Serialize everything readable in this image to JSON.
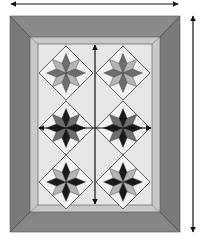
{
  "diagram": {
    "type": "quilt-layout",
    "blocks": {
      "rows": 3,
      "cols": 2,
      "pattern": "eight-point-star",
      "items": [
        {
          "row": 1,
          "col": 1,
          "style": "light",
          "cx": 66,
          "cy": 73
        },
        {
          "row": 1,
          "col": 2,
          "style": "light",
          "cx": 123,
          "cy": 73
        },
        {
          "row": 2,
          "col": 1,
          "style": "dark",
          "cx": 66,
          "cy": 128
        },
        {
          "row": 2,
          "col": 2,
          "style": "dark",
          "cx": 123,
          "cy": 128
        },
        {
          "row": 3,
          "col": 1,
          "style": "medium",
          "cx": 66,
          "cy": 182
        },
        {
          "row": 3,
          "col": 2,
          "style": "medium",
          "cx": 123,
          "cy": 182
        }
      ]
    },
    "measurement_arrows": [
      {
        "name": "overall-width",
        "orientation": "horizontal"
      },
      {
        "name": "overall-height",
        "orientation": "vertical"
      },
      {
        "name": "center-width",
        "orientation": "horizontal"
      },
      {
        "name": "center-height",
        "orientation": "vertical"
      }
    ],
    "colors": {
      "outer_border": "#7a7a7a",
      "outer_border_shade": "#8a8a8a",
      "inner_border": "#c8c8c8",
      "field": "#e6e6e6",
      "star_dark": "#1a1a1a",
      "star_medium": "#6e6e6e",
      "star_light": "#b4b4b4",
      "corner_square": "#f2f2f2",
      "arrow": "#111111"
    }
  }
}
